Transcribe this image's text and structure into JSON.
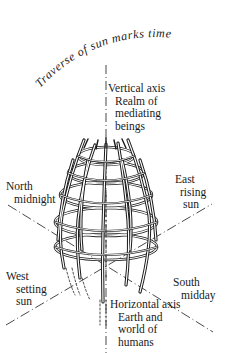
{
  "diagram": {
    "arc_caption": "Traverse of sun marks time",
    "labels": {
      "vertical": [
        "Vertical axis",
        "Realm of",
        "mediating",
        "beings"
      ],
      "north": [
        "North",
        "midnight"
      ],
      "east": [
        "East",
        "rising",
        "sun"
      ],
      "west": [
        "West",
        "setting",
        "sun"
      ],
      "south": [
        "South",
        "midday"
      ],
      "horizontal": [
        "Horizontal axis",
        "Earth and",
        "world of",
        "humans"
      ]
    },
    "colors": {
      "ink": "#1a1a1a",
      "background": "#ffffff"
    }
  }
}
